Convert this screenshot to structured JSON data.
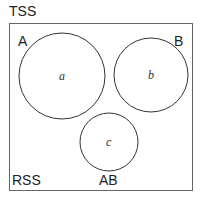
{
  "diagram": {
    "outer_label": "TSS",
    "corner_labels": {
      "top_left": "A",
      "top_right": "B",
      "bottom_left": "RSS",
      "bottom_center": "AB"
    },
    "circles": [
      {
        "label": "a",
        "cx": 62,
        "cy": 76,
        "r": 43
      },
      {
        "label": "b",
        "cx": 151,
        "cy": 75,
        "r": 37
      },
      {
        "label": "c",
        "cx": 109,
        "cy": 142,
        "r": 29
      }
    ],
    "colors": {
      "stroke": "#333333",
      "box": "#666666",
      "text": "#222222"
    }
  }
}
